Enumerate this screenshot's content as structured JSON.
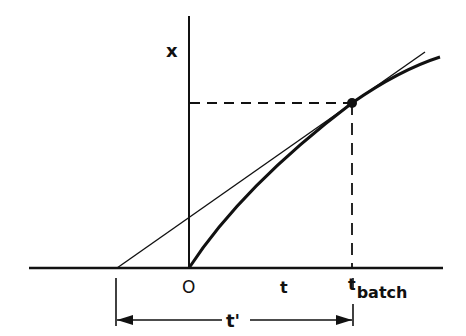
{
  "diagram": {
    "type": "tangent-construction",
    "labels": {
      "y_axis": "x",
      "origin": "O",
      "t": "t",
      "t_batch_main": "t",
      "t_batch_sub": "batch",
      "t_prime": "t'"
    },
    "colors": {
      "ink": "#111111",
      "background": "#ffffff"
    },
    "geometry": {
      "baseline": {
        "x1": 29,
        "x2": 443,
        "y": 268
      },
      "y_axis": {
        "x": 189,
        "y1": 16,
        "y2": 268
      },
      "curve": {
        "from": [
          189,
          268
        ],
        "to": [
          440,
          57
        ],
        "through": [
          352,
          103
        ]
      },
      "tangent": {
        "from": [
          117,
          268
        ],
        "to": [
          425,
          52
        ]
      },
      "point": [
        352,
        103
      ],
      "dashed_horizontal": {
        "x1": 189,
        "x2": 352,
        "y": 103
      },
      "dashed_vertical": {
        "x": 352,
        "y1": 103,
        "y2": 268
      },
      "dimension": {
        "x1": 117,
        "x2": 353,
        "y": 320,
        "tick_top": 278,
        "tick_bottom": 326
      }
    }
  }
}
